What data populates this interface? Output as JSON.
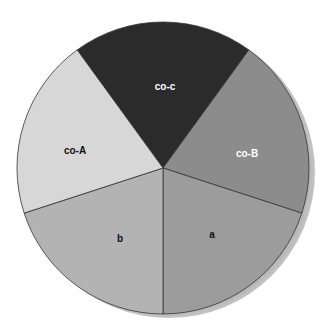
{
  "chart_data": {
    "type": "pie",
    "title": "",
    "start_angle_deg": -36,
    "direction": "clockwise",
    "shadow": true,
    "legend": "none",
    "categories": [
      "co-c",
      "co-B",
      "a",
      "b",
      "co-A"
    ],
    "values": [
      20,
      20,
      20,
      20,
      20
    ],
    "colors": [
      "#2b2b2b",
      "#8c8c8c",
      "#9c9c9c",
      "#b3b3b3",
      "#d7d7d7"
    ],
    "label_colors": [
      "#ffffff",
      "#ffffff",
      "#111111",
      "#111111",
      "#111111"
    ]
  },
  "labels": {
    "co_c": "co-c",
    "co_B": "co-B",
    "a": "a",
    "b": "b",
    "co_A": "co-A"
  }
}
